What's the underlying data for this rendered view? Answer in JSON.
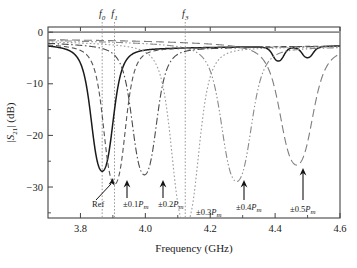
{
  "chart_data": {
    "type": "line",
    "title": "",
    "xlabel": "Frequency (GHz)",
    "ylabel": "|S21| (dB)",
    "ylabel_parts": {
      "bar1": "|",
      "s": "S",
      "sub": "21",
      "bar2": "|",
      "unit": " (dB)"
    },
    "xlim": [
      3.7,
      4.6
    ],
    "ylim": [
      -36,
      1
    ],
    "xticks": [
      3.8,
      4.0,
      4.2,
      4.4,
      4.6
    ],
    "xticklabels": [
      "3.8",
      "4.0",
      "4.2",
      "4.4",
      "4.6"
    ],
    "xminorticks": [
      3.7,
      3.9,
      4.1,
      4.3,
      4.5
    ],
    "yticks": [
      0,
      -10,
      -20,
      -30
    ],
    "yticklabels": [
      "0",
      "−10",
      "−20",
      "−30"
    ],
    "yminorticks": [
      -5,
      -15,
      -25,
      -35
    ],
    "grid": false,
    "legend_position": "none",
    "series": [
      {
        "name": "Ref",
        "label": "Ref",
        "style": "solid",
        "color": "#1a1a1a",
        "notch_freq": 3.867,
        "notch_depth": -23.5,
        "width": 0.085,
        "ripples": [
          {
            "f": 4.41,
            "d": -3.2
          },
          {
            "f": 4.5,
            "d": -2.6
          }
        ]
      },
      {
        "name": "±0.1Pm",
        "label": "±0.1P_m",
        "style": "dashed",
        "color": "#555555",
        "notch_freq": 3.905,
        "notch_depth": -26.0,
        "width": 0.085
      },
      {
        "name": "±0.2Pm",
        "label": "±0.2P_m",
        "style": "dashdot",
        "color": "#4a4a4a",
        "notch_freq": 3.997,
        "notch_depth": -24.2,
        "width": 0.095
      },
      {
        "name": "±0.3Pm",
        "label": "±0.3P_m",
        "style": "dotted",
        "color": "#9a9a9a",
        "notch_freq": 4.123,
        "notch_depth": -34.0,
        "width": 0.105
      },
      {
        "name": "±0.4Pm",
        "label": "±0.4P_m",
        "style": "dashdotdot",
        "color": "#8a8a8a",
        "notch_freq": 4.281,
        "notch_depth": -25.5,
        "width": 0.115
      },
      {
        "name": "±0.5Pm",
        "label": "±0.5P_m",
        "style": "longdash",
        "color": "#7d7d7d",
        "notch_freq": 4.466,
        "notch_depth": -22.3,
        "width": 0.125
      }
    ],
    "vertical_markers": [
      {
        "label": "f0",
        "base": "f",
        "sub": "0",
        "freq": 3.867
      },
      {
        "label": "f1",
        "base": "f",
        "sub": "1",
        "freq": 3.905
      },
      {
        "label": "f3",
        "base": "f",
        "sub": "3",
        "freq": 4.123
      }
    ],
    "annotations": [
      {
        "text": "Ref",
        "freq": 3.867,
        "type": "slanted-arrow",
        "label_x": 92,
        "label_y": 207,
        "arrow_tip_x": 113,
        "arrow_tip_y": 178,
        "arrow_tail_x": 96,
        "arrow_tail_y": 200
      },
      {
        "text": "±0.1P_m",
        "prefix": "±0.1",
        "italic": "P",
        "subscript": "m",
        "freq": 3.905,
        "type": "vertical-arrow",
        "label_x": 123,
        "label_y": 207,
        "arrow_x": 127,
        "arrow_tip_y": 180,
        "arrow_tail_y": 198
      },
      {
        "text": "±0.2P_m",
        "prefix": "±0.2",
        "italic": "P",
        "subscript": "m",
        "freq": 3.997,
        "type": "vertical-arrow",
        "label_x": 158,
        "label_y": 207,
        "arrow_x": 163,
        "arrow_tip_y": 180,
        "arrow_tail_y": 198
      },
      {
        "text": "±0.3P_m",
        "prefix": "±0.3",
        "italic": "P",
        "subscript": "m",
        "freq": 4.123,
        "type": "label-only",
        "label_x": 196,
        "label_y": 215
      },
      {
        "text": "±0.4P_m",
        "prefix": "±0.4",
        "italic": "P",
        "subscript": "m",
        "freq": 4.281,
        "type": "vertical-arrow",
        "label_x": 236,
        "label_y": 210,
        "arrow_x": 244,
        "arrow_tip_y": 180,
        "arrow_tail_y": 200
      },
      {
        "text": "±0.5P_m",
        "prefix": "±0.5",
        "italic": "P",
        "subscript": "m",
        "freq": 4.466,
        "type": "vertical-arrow",
        "label_x": 290,
        "label_y": 212,
        "arrow_x": 303,
        "arrow_tip_y": 168,
        "arrow_tail_y": 200
      }
    ],
    "colors": {
      "frame": "#444444",
      "zero_line": "#8c8c8c",
      "marker_line": "#9a9a9a",
      "text": "#1a1a1a"
    }
  }
}
